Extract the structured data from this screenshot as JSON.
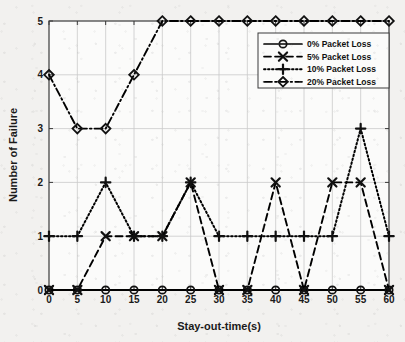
{
  "chart_data": {
    "type": "line",
    "title": "",
    "xlabel": "Stay-out-time(s)",
    "ylabel": "Number of Failure",
    "x": [
      0,
      5,
      10,
      15,
      20,
      25,
      30,
      35,
      40,
      45,
      50,
      55,
      60
    ],
    "xticks": [
      "0",
      "5",
      "10",
      "15",
      "20",
      "25",
      "30",
      "35",
      "40",
      "45",
      "50",
      "55",
      "60"
    ],
    "yticks": [
      "0",
      "1",
      "2",
      "3",
      "4",
      "5"
    ],
    "xlim": [
      0,
      60
    ],
    "ylim": [
      0,
      5
    ],
    "grid": true,
    "legend_position": "upper right",
    "series": [
      {
        "name": "0% Packet Loss",
        "marker": "circle",
        "linestyle": "solid",
        "color": "#000000",
        "values": [
          0,
          0,
          0,
          0,
          0,
          0,
          0,
          0,
          0,
          0,
          0,
          0,
          0
        ]
      },
      {
        "name": "5% Packet Loss",
        "marker": "x",
        "linestyle": "dashed",
        "color": "#000000",
        "values": [
          0,
          0,
          1,
          1,
          1,
          2,
          0,
          0,
          2,
          0,
          2,
          2,
          0
        ]
      },
      {
        "name": "10% Packet Loss",
        "marker": "plus",
        "linestyle": "dotted",
        "color": "#000000",
        "values": [
          1,
          1,
          2,
          1,
          1,
          2,
          1,
          1,
          1,
          1,
          1,
          3,
          1
        ]
      },
      {
        "name": "20% Packet Loss",
        "marker": "diamond",
        "linestyle": "dashdot",
        "color": "#000000",
        "values": [
          4,
          3,
          3,
          4,
          5,
          5,
          5,
          5,
          5,
          5,
          5,
          5,
          5
        ]
      }
    ]
  },
  "legend": {
    "entries": [
      {
        "label": "0% Packet Loss"
      },
      {
        "label": "5% Packet Loss"
      },
      {
        "label": "10% Packet Loss"
      },
      {
        "label": "20% Packet Loss"
      }
    ]
  },
  "axes": {
    "x_label": "Stay-out-time(s)",
    "y_label": "Number of Failure",
    "x_tick_labels": [
      "0",
      "5",
      "10",
      "15",
      "20",
      "25",
      "30",
      "35",
      "40",
      "45",
      "50",
      "55",
      "60"
    ],
    "y_tick_labels": [
      "0",
      "1",
      "2",
      "3",
      "4",
      "5"
    ]
  },
  "colors": {
    "ink": "#111111",
    "grid": "#c9c9c9",
    "background": "#f2f1ef",
    "plot_background": "#fbfbfa"
  }
}
